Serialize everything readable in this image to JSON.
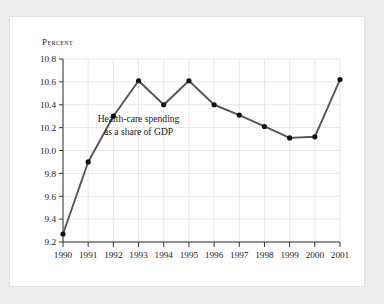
{
  "chart_data": {
    "type": "line",
    "title": "",
    "subtitle": "",
    "ylabel": "Percent",
    "xlabel": "",
    "categories": [
      "1990",
      "1991",
      "1992",
      "1993",
      "1994",
      "1995",
      "1996",
      "1997",
      "1998",
      "1999",
      "2000",
      "2001"
    ],
    "series": [
      {
        "name": "Health-care spending as a share of GDP",
        "values": [
          9.27,
          9.9,
          10.3,
          10.61,
          10.4,
          10.61,
          10.4,
          10.31,
          10.21,
          10.11,
          10.12,
          10.62
        ]
      }
    ],
    "ylim": [
      9.2,
      10.8
    ],
    "ytick_labels": [
      "9.2",
      "9.4",
      "9.6",
      "9.8",
      "10.0",
      "10.2",
      "10.4",
      "10.6",
      "10.8"
    ],
    "ytick_values": [
      9.2,
      9.4,
      9.6,
      9.8,
      10.0,
      10.2,
      10.4,
      10.6,
      10.8
    ],
    "grid": true,
    "legend": "none",
    "annotations": [
      {
        "name": "series-annotation",
        "line1": "Health-care spending",
        "line2": "as a share of GDP",
        "x": 1993.0,
        "y": 10.25
      }
    ],
    "colors": {
      "line": "#555555",
      "marker": "#111111",
      "grid": "#dcdcdc",
      "axis": "#333333",
      "text": "#1a1a1a",
      "card_background": "#ffffff",
      "page_background": "#ececec"
    }
  }
}
